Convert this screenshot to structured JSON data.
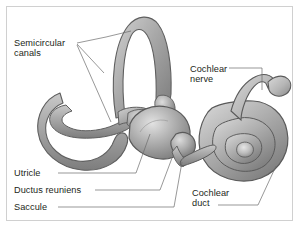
{
  "figure": {
    "background_color": "#ffffff",
    "frame_color": "#d0d0d0",
    "text_color": "#231f20"
  },
  "labels": {
    "semicircular_canals": "Semicircular\ncanals",
    "cochlear_nerve": "Cochlear\nnerve",
    "utricle": "Utricle",
    "ductus_reuniens": "Ductus reuniens",
    "saccule": "Saccule",
    "cochlear_duct": "Cochlear\nduct"
  },
  "structures": {
    "semicircular_canals": "semicircular-canals-structure",
    "vestibule": "vestibule-structure",
    "utricle": "utricle-structure",
    "saccule": "saccule-structure",
    "ductus_reuniens": "ductus-reuniens-structure",
    "cochlea": "cochlea-spiral-structure",
    "cochlear_nerve": "cochlear-nerve-structure"
  },
  "palette": {
    "tissue_light": "#d8d8d8",
    "tissue_mid": "#b3b3b3",
    "tissue_dark": "#8e8e8e",
    "tissue_shadow": "#6f6f6f",
    "outline": "#5a5a5a",
    "leader_line": "#6b6b6b"
  }
}
